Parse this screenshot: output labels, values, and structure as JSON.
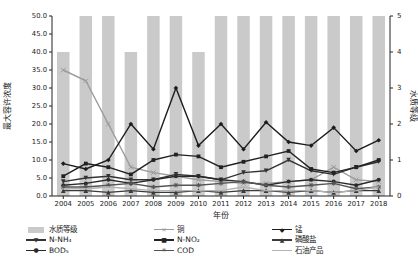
{
  "chart_data": {
    "type": "bar+line combo",
    "title": "",
    "x": {
      "label": "年份",
      "categories": [
        "2004",
        "2005",
        "2006",
        "2007",
        "2008",
        "2009",
        "2010",
        "2011",
        "2012",
        "2013",
        "2014",
        "2015",
        "2016",
        "2017",
        "2018"
      ]
    },
    "y_left": {
      "label": "最大容许浓度",
      "min": 0,
      "max": 50,
      "tick_step": 5,
      "tick_labels": [
        "0.0",
        "5.0",
        "10.0",
        "15.0",
        "20.0",
        "25.0",
        "30.0",
        "35.0",
        "40.0",
        "45.0",
        "50.0"
      ]
    },
    "y_right": {
      "label": "水质等级",
      "min": 0,
      "max": 5,
      "tick_step": 1,
      "tick_labels": [
        "0",
        "1",
        "2",
        "3",
        "4",
        "5"
      ]
    },
    "grid": false,
    "legend_position": "bottom",
    "bars": {
      "name": "水质等级",
      "axis": "right",
      "color": "#cacaca",
      "values": [
        4,
        5,
        5,
        4,
        5,
        5,
        4,
        5,
        5,
        5,
        5,
        5,
        5,
        5,
        5
      ]
    },
    "series": [
      {
        "name": "铜",
        "axis": "left",
        "color": "#9b9b9b",
        "marker": "x",
        "values": [
          35,
          32,
          20,
          8,
          6.5,
          5.5,
          4.5,
          4,
          3.5,
          3.5,
          4,
          4.5,
          8,
          4.5,
          4
        ]
      },
      {
        "name": "锰",
        "axis": "left",
        "color": "#1c1c1c",
        "marker": "diamond",
        "values": [
          9,
          7.5,
          10,
          20,
          13,
          30,
          14,
          20,
          13,
          20.5,
          15,
          14,
          19,
          12.5,
          15.5
        ]
      },
      {
        "name": "N-NH₄",
        "axis": "left",
        "color": "#333333",
        "marker": "triangle-down",
        "values": [
          4,
          5,
          5.5,
          4.5,
          4.5,
          6,
          5.5,
          4.5,
          6.5,
          7,
          10,
          7,
          6,
          8,
          9.5
        ]
      },
      {
        "name": "N-NO₂",
        "axis": "left",
        "color": "#222222",
        "marker": "square",
        "values": [
          5.5,
          9,
          8,
          6,
          10,
          11.5,
          11,
          8,
          9.5,
          11,
          12.5,
          7.5,
          6.5,
          8,
          10
        ]
      },
      {
        "name": "磷酸盐",
        "axis": "left",
        "color": "#3a3a3a",
        "marker": "triangle-up",
        "values": [
          1.5,
          1.5,
          1,
          1.5,
          1,
          1,
          1.5,
          1,
          1.5,
          1.5,
          1,
          1.5,
          1,
          1.5,
          1.5
        ]
      },
      {
        "name": "BOD₅",
        "axis": "left",
        "color": "#2a2a2a",
        "marker": "circle",
        "values": [
          3,
          3.5,
          4.5,
          3.5,
          4.5,
          5.5,
          5.5,
          4.5,
          4,
          3,
          4,
          4.5,
          4,
          3,
          4.5
        ]
      },
      {
        "name": "COD",
        "axis": "left",
        "color": "#555555",
        "marker": "asterisk",
        "values": [
          2.5,
          2.5,
          3,
          3.5,
          2.5,
          3,
          3,
          3.5,
          4,
          3,
          2.5,
          3,
          3.5,
          2,
          2.5
        ]
      },
      {
        "name": "石油产品",
        "axis": "left",
        "color": "#b2b2b2",
        "marker": "none",
        "values": [
          2,
          2,
          2.5,
          2,
          1.5,
          1.5,
          1.5,
          1.5,
          2.5,
          1.5,
          1.5,
          1.5,
          1,
          1.5,
          2.5
        ]
      }
    ]
  },
  "legend": {
    "items": [
      {
        "label": "水质等级",
        "swatch": "bar",
        "color": "#cacaca"
      },
      {
        "label": "铜",
        "swatch": "line",
        "marker": "x",
        "color": "#9b9b9b"
      },
      {
        "label": "锰",
        "swatch": "line",
        "marker": "diamond",
        "color": "#1c1c1c"
      },
      {
        "label": "N-NH₄",
        "swatch": "line",
        "marker": "triangle-down",
        "color": "#333333"
      },
      {
        "label": "N-NO₂",
        "swatch": "line",
        "marker": "square",
        "color": "#222222"
      },
      {
        "label": "磷酸盐",
        "swatch": "line",
        "marker": "triangle-up",
        "color": "#3a3a3a"
      },
      {
        "label": "BOD₅",
        "swatch": "line",
        "marker": "circle",
        "color": "#2a2a2a"
      },
      {
        "label": "COD",
        "swatch": "line",
        "marker": "asterisk",
        "color": "#555555"
      },
      {
        "label": "石油产品",
        "swatch": "line",
        "marker": "none",
        "color": "#b2b2b2"
      }
    ]
  },
  "axis_titles": {
    "left": "最大容许浓度",
    "right": "水质等级",
    "bottom": "年份"
  }
}
